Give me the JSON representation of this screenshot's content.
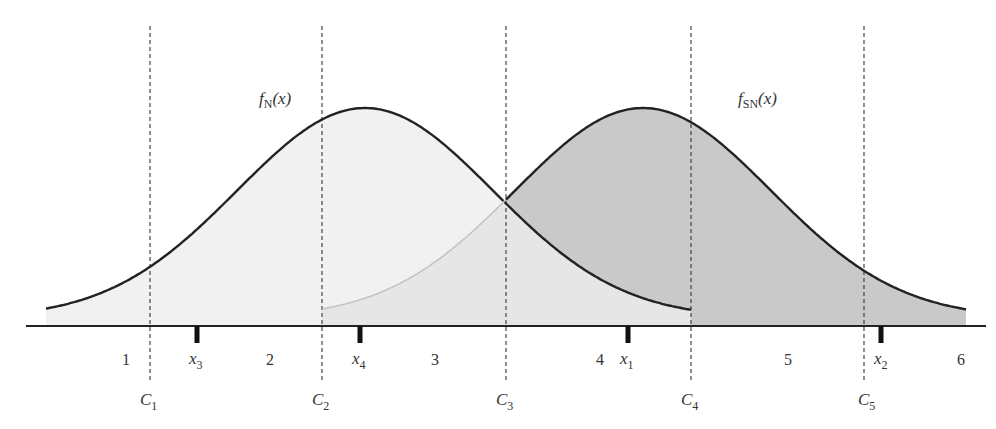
{
  "chart_data": {
    "type": "area",
    "title": "",
    "xlabel": "",
    "ylabel": "",
    "grid": false,
    "legend": "none",
    "curves": [
      {
        "name": "f_N(x)",
        "label_main": "f",
        "label_sub": "N",
        "label_arg": "(x)",
        "mean_px": 365,
        "peak_y_px": 108,
        "sigma_px": 128,
        "fill": "#f1f1f1"
      },
      {
        "name": "f_SN(x)",
        "label_main": "f",
        "label_sub": "SN",
        "label_arg": "(x)",
        "mean_px": 643,
        "peak_y_px": 108,
        "sigma_px": 128,
        "fill": "#c9c9c9"
      }
    ],
    "criteria": [
      {
        "name": "C1",
        "main": "C",
        "sub": "1",
        "x_px": 150
      },
      {
        "name": "C2",
        "main": "C",
        "sub": "2",
        "x_px": 322
      },
      {
        "name": "C3",
        "main": "C",
        "sub": "3",
        "x_px": 506
      },
      {
        "name": "C4",
        "main": "C",
        "sub": "4",
        "x_px": 691
      },
      {
        "name": "C5",
        "main": "C",
        "sub": "5",
        "x_px": 864
      }
    ],
    "observations": [
      {
        "name": "x3",
        "main": "x",
        "sub": "3",
        "x_px": 197
      },
      {
        "name": "x4",
        "main": "x",
        "sub": "4",
        "x_px": 360
      },
      {
        "name": "x1",
        "main": "x",
        "sub": "1",
        "x_px": 628
      },
      {
        "name": "x2",
        "main": "x",
        "sub": "2",
        "x_px": 881
      }
    ],
    "regions": [
      {
        "label": "1",
        "x_px": 126
      },
      {
        "label": "2",
        "x_px": 270
      },
      {
        "label": "3",
        "x_px": 435
      },
      {
        "label": "4",
        "x_px": 600
      },
      {
        "label": "5",
        "x_px": 788
      },
      {
        "label": "6",
        "x_px": 961
      }
    ]
  },
  "labels": {
    "fN_main": "f",
    "fN_sub": "N",
    "fN_arg": "(x)",
    "fSN_main": "f",
    "fSN_sub": "SN",
    "fSN_arg": "(x)",
    "region_1": "1",
    "region_2": "2",
    "region_3": "3",
    "region_4": "4",
    "region_5": "5",
    "region_6": "6",
    "x1_main": "x",
    "x1_sub": "1",
    "x2_main": "x",
    "x2_sub": "2",
    "x3_main": "x",
    "x3_sub": "3",
    "x4_main": "x",
    "x4_sub": "4",
    "c1_main": "C",
    "c1_sub": "1",
    "c2_main": "C",
    "c2_sub": "2",
    "c3_main": "C",
    "c3_sub": "3",
    "c4_main": "C",
    "c4_sub": "4",
    "c5_main": "C",
    "c5_sub": "5"
  },
  "colors": {
    "noise_fill": "#f1f1f1",
    "signal_fill": "#c9c9c9",
    "overlap_fill": "#e4e4e4",
    "curve_stroke": "#222222",
    "dash_stroke": "#333333",
    "axis_stroke": "#222222"
  }
}
